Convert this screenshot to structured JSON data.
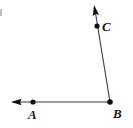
{
  "figure": {
    "kind": "geometry-angle-diagram",
    "width": 133,
    "height": 128,
    "background_color": "#ffffff",
    "stroke_color": "#3a3a3e",
    "dot_color": "#101012",
    "stroke_width": 1.1,
    "vertex": "B",
    "points": [
      {
        "name": "A",
        "label": "A",
        "x": 33,
        "y": 102,
        "dot_radius": 2.6,
        "label_x": 28,
        "label_y": 108
      },
      {
        "name": "B",
        "label": "B",
        "x": 110,
        "y": 102,
        "dot_radius": 2.8,
        "label_x": 113,
        "label_y": 107
      },
      {
        "name": "C",
        "label": "C",
        "x": 97,
        "y": 26,
        "dot_radius": 2.6,
        "label_x": 102,
        "label_y": 20
      }
    ],
    "rays": [
      {
        "name": "ray-BA",
        "from": "B",
        "through": "A",
        "start_x": 110,
        "start_y": 102,
        "end_x": 13,
        "end_y": 102,
        "arrow_tip_x": 11,
        "arrow_tip_y": 102,
        "arrow_at": "end"
      },
      {
        "name": "ray-BC",
        "from": "B",
        "through": "C",
        "start_x": 110,
        "start_y": 102,
        "end_x": 95.5,
        "end_y": 13,
        "arrow_tip_x": 94,
        "arrow_tip_y": 5,
        "arrow_at": "end"
      }
    ],
    "artifact": {
      "name": "left-edge-speck",
      "x": 0,
      "y": 9,
      "width": 2,
      "height": 7,
      "color": "#bdbdbd"
    }
  }
}
